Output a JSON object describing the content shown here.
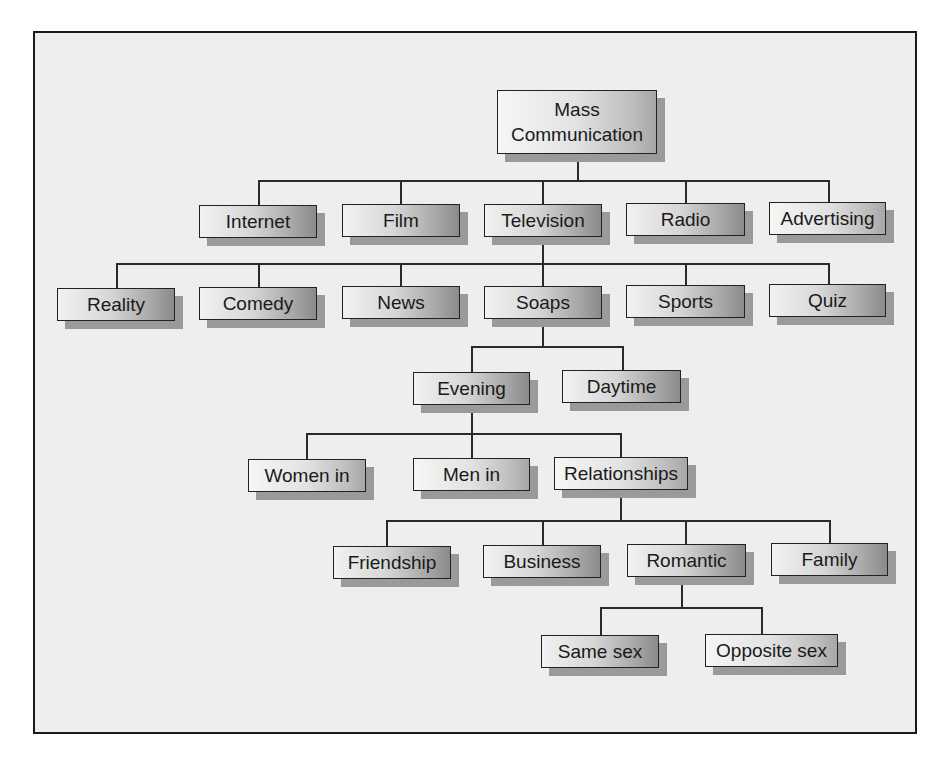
{
  "diagram": {
    "type": "hierarchy-tree",
    "root": {
      "label_line1": "Mass",
      "label_line2": "Communication"
    },
    "level1": [
      {
        "label": "Internet"
      },
      {
        "label": "Film"
      },
      {
        "label": "Television"
      },
      {
        "label": "Radio"
      },
      {
        "label": "Advertising"
      }
    ],
    "television_children": [
      {
        "label": "Reality"
      },
      {
        "label": "Comedy"
      },
      {
        "label": "News"
      },
      {
        "label": "Soaps"
      },
      {
        "label": "Sports"
      },
      {
        "label": "Quiz"
      }
    ],
    "soaps_children": [
      {
        "label": "Evening"
      },
      {
        "label": "Daytime"
      }
    ],
    "evening_children": [
      {
        "label": "Women in"
      },
      {
        "label": "Men in"
      },
      {
        "label": "Relationships"
      }
    ],
    "relationships_children": [
      {
        "label": "Friendship"
      },
      {
        "label": "Business"
      },
      {
        "label": "Romantic"
      },
      {
        "label": "Family"
      }
    ],
    "romantic_children": [
      {
        "label": "Same sex"
      },
      {
        "label": "Opposite sex"
      }
    ],
    "colors": {
      "frame_border": "#1a1a1a",
      "background": "#eeeeec",
      "connector": "#2a2a2a",
      "shadow": "#9a9a9a",
      "box_gradient_light": "#f2f2f2",
      "box_gradient_dark": "#8a8a8a",
      "text": "#1a1a1a"
    }
  }
}
